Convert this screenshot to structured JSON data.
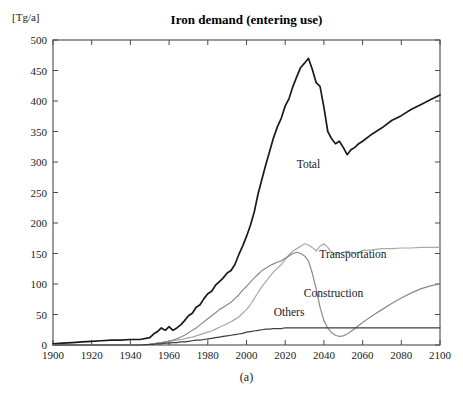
{
  "figure": {
    "title": "Iron demand (entering use)",
    "unit_label": "[Tg/a]",
    "caption": "(a)"
  },
  "colors": {
    "total_line": "#1a1a1a",
    "others_line": "#3c3c3c",
    "construction_line": "#8a8a8a",
    "transportation_line": "#a8a8a8",
    "axis": "#4a4a4a",
    "text": "#1a1a1a",
    "background": "#ffffff"
  },
  "chart_data": {
    "type": "line",
    "title": "Iron demand (entering use)",
    "xlabel": "",
    "ylabel": "[Tg/a]",
    "xlim": [
      1900,
      2100
    ],
    "ylim": [
      0,
      500
    ],
    "xticks": [
      1900,
      1920,
      1940,
      1960,
      1980,
      2000,
      2020,
      2040,
      2060,
      2080,
      2100
    ],
    "yticks": [
      0,
      50,
      100,
      150,
      200,
      250,
      300,
      350,
      400,
      450,
      500
    ],
    "grid": false,
    "legend": "inline-annotations",
    "annotations": [
      {
        "label": "Total",
        "x": 2032,
        "y": 290
      },
      {
        "label": "Transportation",
        "x": 2055,
        "y": 142
      },
      {
        "label": "Construction",
        "x": 2045,
        "y": 78
      },
      {
        "label": "Others",
        "x": 2022,
        "y": 48
      }
    ],
    "x": [
      1900,
      1905,
      1910,
      1915,
      1920,
      1925,
      1930,
      1935,
      1940,
      1945,
      1950,
      1952,
      1954,
      1956,
      1958,
      1960,
      1962,
      1964,
      1966,
      1968,
      1970,
      1972,
      1974,
      1976,
      1978,
      1980,
      1982,
      1984,
      1986,
      1988,
      1990,
      1992,
      1994,
      1996,
      1998,
      2000,
      2002,
      2004,
      2006,
      2008,
      2010,
      2012,
      2014,
      2016,
      2018,
      2020,
      2022,
      2024,
      2026,
      2028,
      2030,
      2032,
      2034,
      2036,
      2038,
      2040,
      2042,
      2044,
      2046,
      2048,
      2050,
      2052,
      2054,
      2056,
      2058,
      2060,
      2065,
      2070,
      2075,
      2080,
      2085,
      2090,
      2095,
      2100
    ],
    "series": [
      {
        "name": "Total",
        "color": "#1a1a1a",
        "values": [
          2,
          3,
          4,
          5,
          6,
          7,
          8,
          8,
          9,
          9,
          12,
          18,
          22,
          28,
          24,
          30,
          24,
          28,
          33,
          40,
          48,
          52,
          62,
          66,
          76,
          84,
          88,
          98,
          104,
          110,
          118,
          122,
          132,
          148,
          162,
          178,
          196,
          218,
          248,
          272,
          296,
          318,
          340,
          358,
          372,
          392,
          404,
          424,
          440,
          455,
          462,
          470,
          452,
          430,
          424,
          390,
          350,
          338,
          330,
          334,
          324,
          312,
          320,
          324,
          330,
          334,
          346,
          356,
          368,
          376,
          386,
          394,
          402,
          410
        ]
      },
      {
        "name": "Transportation",
        "color": "#a8a8a8",
        "values": [
          0,
          0,
          0,
          0,
          0,
          0,
          0,
          0,
          0,
          0,
          1,
          2,
          3,
          4,
          5,
          6,
          7,
          8,
          9,
          10,
          12,
          13,
          15,
          17,
          19,
          21,
          23,
          26,
          29,
          32,
          35,
          38,
          42,
          46,
          52,
          58,
          66,
          76,
          86,
          96,
          104,
          112,
          120,
          126,
          132,
          140,
          148,
          154,
          158,
          162,
          166,
          164,
          160,
          154,
          162,
          166,
          160,
          152,
          148,
          150,
          152,
          154,
          152,
          150,
          152,
          155,
          156,
          158,
          158,
          159,
          159,
          160,
          160,
          160
        ]
      },
      {
        "name": "Construction",
        "color": "#8a8a8a",
        "values": [
          0,
          0,
          0,
          0,
          0,
          0,
          0,
          0,
          0,
          0,
          1,
          2,
          3,
          4,
          5,
          6,
          8,
          10,
          13,
          16,
          20,
          24,
          28,
          33,
          38,
          43,
          48,
          53,
          58,
          62,
          66,
          70,
          76,
          82,
          90,
          96,
          103,
          110,
          116,
          122,
          126,
          130,
          133,
          136,
          138,
          142,
          146,
          150,
          152,
          150,
          146,
          138,
          118,
          92,
          62,
          40,
          28,
          20,
          16,
          14,
          15,
          18,
          22,
          27,
          32,
          37,
          48,
          58,
          68,
          77,
          85,
          92,
          97,
          100
        ]
      },
      {
        "name": "Others",
        "color": "#3c3c3c",
        "values": [
          0,
          0,
          0,
          0,
          0,
          0,
          0,
          0,
          0,
          0,
          1,
          1,
          2,
          2,
          3,
          3,
          4,
          4,
          5,
          5,
          6,
          7,
          8,
          8,
          9,
          10,
          11,
          12,
          13,
          14,
          15,
          16,
          17,
          18,
          19,
          21,
          22,
          23,
          24,
          25,
          26,
          26,
          27,
          27,
          27,
          28,
          28,
          28,
          28,
          28,
          28,
          28,
          28,
          28,
          28,
          28,
          28,
          28,
          28,
          28,
          28,
          28,
          28,
          28,
          28,
          28,
          28,
          28,
          28,
          28,
          28,
          28,
          28,
          28
        ]
      }
    ]
  }
}
